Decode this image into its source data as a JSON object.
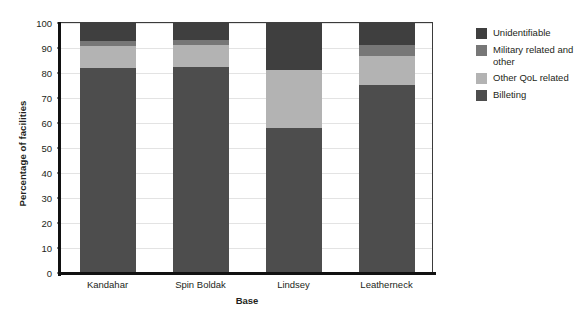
{
  "chart_data": {
    "type": "bar",
    "stacked": true,
    "title": "",
    "xlabel": "Base",
    "ylabel": "Percentage of facilities",
    "categories": [
      "Kandahar",
      "Spin Boldak",
      "Lindsey",
      "Leatherneck"
    ],
    "ylim": [
      0,
      100
    ],
    "yticks": [
      0,
      10,
      20,
      30,
      40,
      50,
      60,
      70,
      80,
      90,
      100
    ],
    "grid": "horizontal",
    "legend_position": "right",
    "series": [
      {
        "name": "Billeting",
        "color": "#4d4d4d",
        "values": [
          81.5,
          82,
          57.5,
          75
        ]
      },
      {
        "name": "Other QoL related",
        "color": "#b3b3b3",
        "values": [
          9,
          9,
          23.5,
          11.5
        ]
      },
      {
        "name": "Military related and other",
        "color": "#777777",
        "values": [
          2,
          2,
          0,
          4.5
        ]
      },
      {
        "name": "Unidentifiable",
        "color": "#3f3f3f",
        "values": [
          7.5,
          7,
          19,
          9
        ]
      }
    ]
  },
  "legend": {
    "items": [
      {
        "label": "Unidentifiable",
        "color": "#3f3f3f"
      },
      {
        "label": "Military related and other",
        "color": "#777777"
      },
      {
        "label": "Other QoL related",
        "color": "#b3b3b3"
      },
      {
        "label": "Billeting",
        "color": "#4d4d4d"
      }
    ]
  },
  "axis": {
    "y_title": "Percentage of facilities",
    "x_title": "Base",
    "y_ticks": [
      "0",
      "10",
      "20",
      "30",
      "40",
      "50",
      "60",
      "70",
      "80",
      "90",
      "100"
    ],
    "x_ticks": [
      "Kandahar",
      "Spin Boldak",
      "Lindsey",
      "Leatherneck"
    ]
  }
}
